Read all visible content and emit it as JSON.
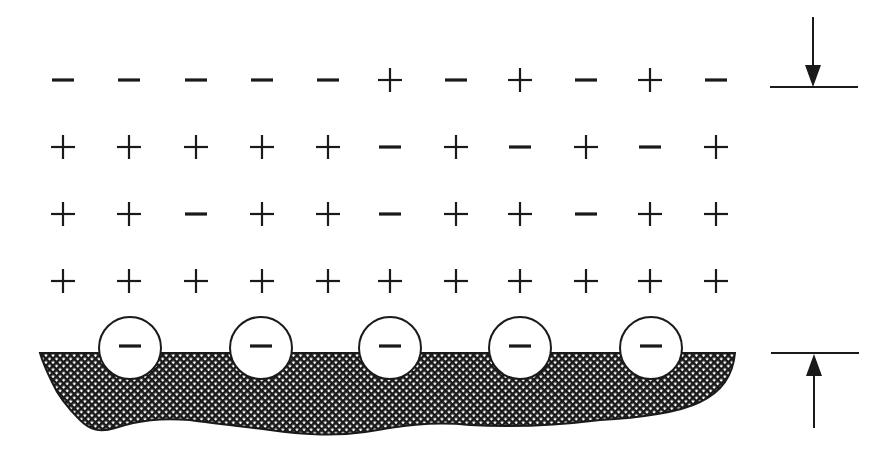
{
  "diagram": {
    "colors": {
      "ink": "#1a1a1a",
      "background": "#ffffff",
      "circle_fill": "#ffffff"
    },
    "grid": {
      "columns_x": [
        63,
        129,
        196,
        262,
        328,
        390,
        456,
        520,
        586,
        650,
        716
      ],
      "rows_y": [
        80,
        147,
        214,
        281
      ],
      "rows": [
        [
          "-",
          "-",
          "-",
          "-",
          "-",
          "+",
          "-",
          "+",
          "-",
          "+",
          "-"
        ],
        [
          "+",
          "+",
          "+",
          "+",
          "+",
          "-",
          "+",
          "-",
          "+",
          "-",
          "+"
        ],
        [
          "+",
          "+",
          "-",
          "+",
          "+",
          "-",
          "+",
          "+",
          "-",
          "+",
          "+"
        ],
        [
          "+",
          "+",
          "+",
          "+",
          "+",
          "+",
          "+",
          "+",
          "+",
          "+",
          "+"
        ]
      ]
    },
    "surface": {
      "label": "charged solid surface",
      "top_y": 353,
      "fill_pattern": "crosshatch",
      "adsorbed_ions": [
        {
          "cx": 130,
          "cy": 348,
          "r": 31,
          "sign": "-"
        },
        {
          "cx": 261,
          "cy": 348,
          "r": 31,
          "sign": "-"
        },
        {
          "cx": 390,
          "cy": 348,
          "r": 31,
          "sign": "-"
        },
        {
          "cx": 520,
          "cy": 348,
          "r": 31,
          "sign": "-"
        },
        {
          "cx": 651,
          "cy": 348,
          "r": 31,
          "sign": "-"
        }
      ]
    },
    "thickness_marker": {
      "top_line": {
        "x1": 770,
        "x2": 858,
        "y": 87
      },
      "bottom_line": {
        "x1": 771,
        "x2": 859,
        "y": 353
      },
      "top_arrow": {
        "x": 813,
        "from_y": 17,
        "to_y": 87,
        "direction": "down"
      },
      "bottom_arrow": {
        "x": 814,
        "from_y": 428,
        "to_y": 354,
        "direction": "up"
      }
    }
  }
}
